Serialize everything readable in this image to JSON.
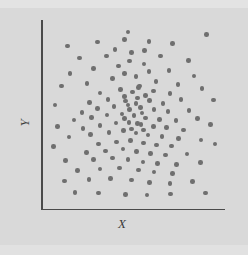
{
  "figure": {
    "background_color": "#d9d9d9",
    "axis_color": "#4a4a4a",
    "dot_color": "#6f6f6f"
  },
  "labels": {
    "x": "X",
    "y": "Y"
  },
  "chart_data": {
    "type": "scatter",
    "title": "",
    "subtitle": "",
    "xlabel": "X",
    "ylabel": "Y",
    "xlim": [
      0,
      100
    ],
    "ylim": [
      0,
      100
    ],
    "grid": false,
    "legend": null,
    "ticks": {
      "x": [],
      "y": []
    },
    "marker": {
      "shape": "circle",
      "size_px": 4.6,
      "color": "#6f6f6f"
    },
    "n_points": 128,
    "points": [
      [
        11.1,
        88.6
      ],
      [
        28.3,
        90.8
      ],
      [
        43.8,
        92.4
      ],
      [
        58.1,
        91.3
      ],
      [
        71.4,
        90.0
      ],
      [
        91.2,
        95.1
      ],
      [
        18.0,
        81.8
      ],
      [
        33.5,
        83.0
      ],
      [
        48.0,
        84.8
      ],
      [
        64.5,
        82.9
      ],
      [
        80.7,
        80.4
      ],
      [
        12.6,
        73.0
      ],
      [
        26.0,
        75.7
      ],
      [
        40.4,
        77.2
      ],
      [
        55.2,
        78.3
      ],
      [
        69.5,
        74.8
      ],
      [
        84.0,
        71.5
      ],
      [
        7.8,
        66.0
      ],
      [
        22.5,
        67.4
      ],
      [
        37.0,
        70.1
      ],
      [
        50.5,
        71.2
      ],
      [
        62.0,
        68.6
      ],
      [
        74.8,
        66.9
      ],
      [
        88.5,
        64.6
      ],
      [
        30.0,
        62.0
      ],
      [
        41.5,
        64.0
      ],
      [
        52.0,
        65.2
      ],
      [
        60.5,
        63.1
      ],
      [
        70.0,
        61.8
      ],
      [
        24.0,
        56.5
      ],
      [
        34.5,
        58.4
      ],
      [
        44.0,
        60.0
      ],
      [
        51.5,
        59.2
      ],
      [
        58.5,
        57.8
      ],
      [
        66.0,
        56.0
      ],
      [
        76.5,
        58.2
      ],
      [
        19.5,
        51.0
      ],
      [
        28.5,
        53.0
      ],
      [
        38.0,
        54.2
      ],
      [
        46.0,
        55.0
      ],
      [
        53.0,
        53.8
      ],
      [
        61.0,
        52.6
      ],
      [
        69.0,
        51.4
      ],
      [
        81.0,
        52.0
      ],
      [
        15.0,
        46.5
      ],
      [
        25.0,
        48.0
      ],
      [
        34.0,
        49.5
      ],
      [
        42.5,
        50.1
      ],
      [
        49.5,
        49.0
      ],
      [
        56.0,
        47.8
      ],
      [
        64.0,
        47.0
      ],
      [
        73.5,
        46.2
      ],
      [
        86.0,
        47.4
      ],
      [
        20.0,
        41.8
      ],
      [
        30.0,
        43.5
      ],
      [
        39.0,
        44.8
      ],
      [
        46.5,
        45.2
      ],
      [
        53.5,
        44.0
      ],
      [
        60.5,
        43.0
      ],
      [
        68.0,
        42.2
      ],
      [
        78.0,
        41.0
      ],
      [
        12.0,
        37.0
      ],
      [
        24.5,
        38.4
      ],
      [
        35.0,
        39.6
      ],
      [
        43.5,
        40.5
      ],
      [
        50.5,
        39.2
      ],
      [
        57.5,
        38.0
      ],
      [
        65.5,
        37.2
      ],
      [
        75.0,
        36.0
      ],
      [
        88.0,
        35.2
      ],
      [
        29.0,
        33.0
      ],
      [
        39.5,
        34.2
      ],
      [
        47.5,
        34.8
      ],
      [
        55.0,
        33.6
      ],
      [
        62.5,
        32.4
      ],
      [
        71.0,
        31.8
      ],
      [
        22.0,
        28.0
      ],
      [
        33.0,
        29.0
      ],
      [
        43.0,
        30.0
      ],
      [
        51.0,
        28.6
      ],
      [
        59.0,
        27.6
      ],
      [
        67.5,
        26.8
      ],
      [
        80.0,
        27.2
      ],
      [
        10.0,
        23.5
      ],
      [
        26.0,
        24.0
      ],
      [
        37.0,
        25.0
      ],
      [
        46.0,
        24.2
      ],
      [
        54.5,
        22.8
      ],
      [
        63.0,
        22.0
      ],
      [
        74.0,
        21.2
      ],
      [
        87.5,
        22.6
      ],
      [
        17.0,
        18.0
      ],
      [
        30.0,
        18.8
      ],
      [
        41.0,
        19.4
      ],
      [
        52.0,
        18.2
      ],
      [
        61.0,
        17.0
      ],
      [
        71.5,
        16.2
      ],
      [
        9.5,
        12.0
      ],
      [
        23.5,
        12.8
      ],
      [
        36.0,
        13.2
      ],
      [
        48.0,
        12.4
      ],
      [
        58.5,
        11.0
      ],
      [
        70.0,
        10.4
      ],
      [
        83.0,
        11.6
      ],
      [
        15.5,
        5.5
      ],
      [
        29.0,
        5.0
      ],
      [
        44.5,
        4.4
      ],
      [
        57.0,
        4.0
      ],
      [
        70.5,
        4.6
      ],
      [
        90.5,
        5.2
      ],
      [
        4.0,
        55.0
      ],
      [
        5.5,
        43.0
      ],
      [
        3.0,
        31.5
      ],
      [
        95.0,
        58.0
      ],
      [
        93.5,
        44.0
      ],
      [
        96.0,
        33.0
      ],
      [
        46.0,
        96.5
      ],
      [
        55.5,
        86.0
      ],
      [
        38.5,
        86.5
      ],
      [
        47.0,
        80.0
      ],
      [
        58.0,
        74.0
      ],
      [
        44.0,
        73.0
      ],
      [
        52.5,
        66.0
      ],
      [
        56.0,
        60.5
      ],
      [
        48.5,
        62.5
      ],
      [
        44.5,
        57.5
      ],
      [
        50.5,
        56.0
      ],
      [
        54.0,
        50.5
      ],
      [
        47.0,
        52.5
      ],
      [
        44.0,
        47.5
      ],
      [
        51.5,
        44.5
      ],
      [
        55.0,
        41.0
      ],
      [
        48.0,
        41.5
      ]
    ]
  }
}
